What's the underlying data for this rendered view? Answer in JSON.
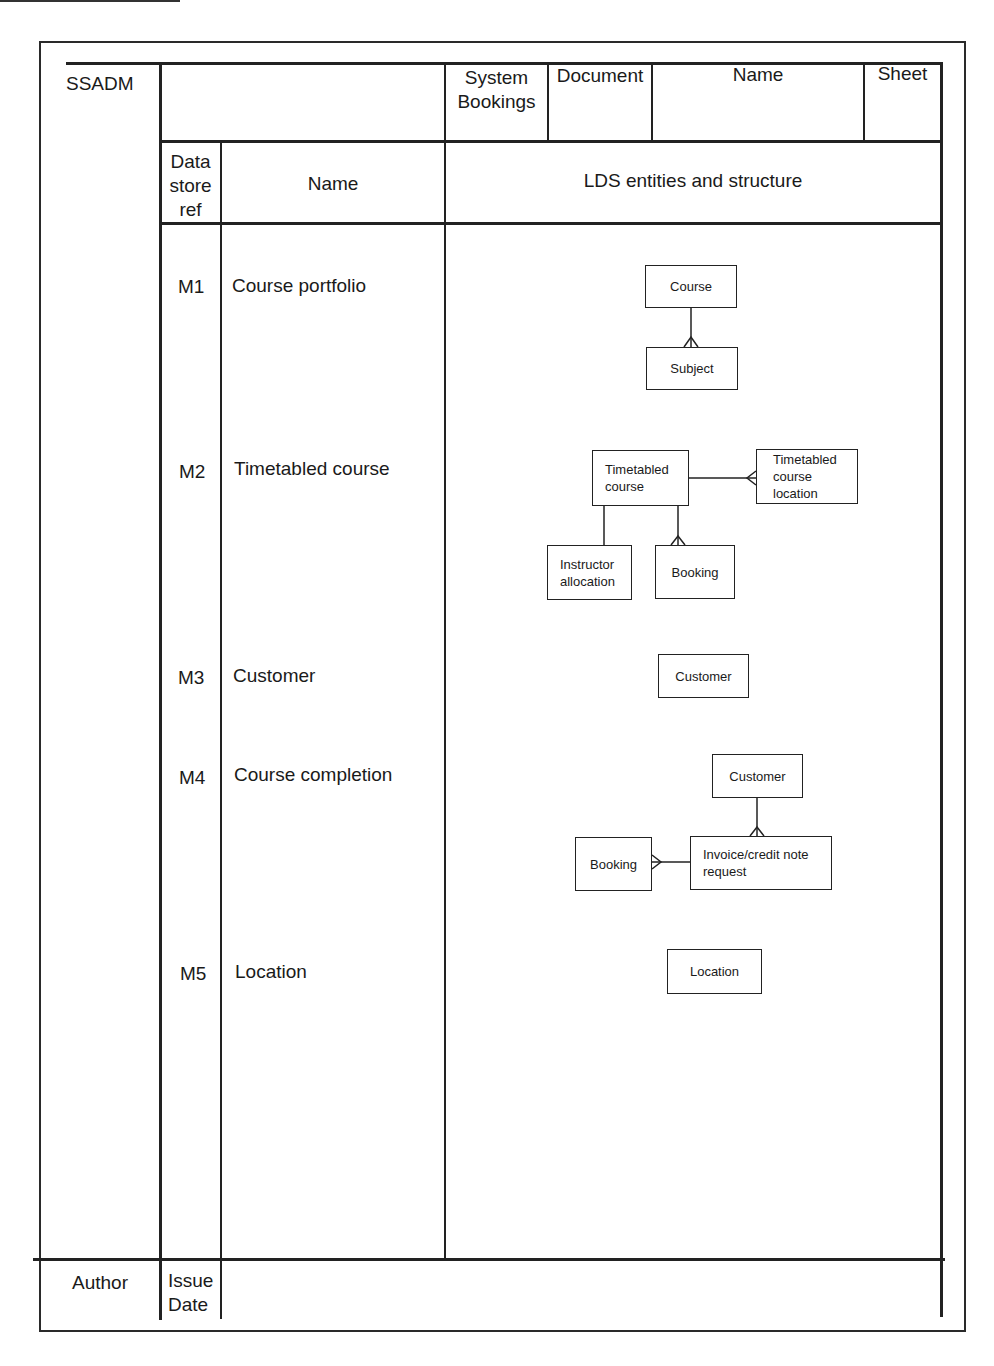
{
  "form": {
    "method": "SSADM",
    "header": {
      "system_label": "System",
      "system_value": "Bookings",
      "document_label": "Document",
      "name_label": "Name",
      "sheet_label": "Sheet"
    },
    "columns": {
      "ref": "Data store ref",
      "ref_lines": [
        "Data",
        "store",
        "ref"
      ],
      "name": "Name",
      "structure": "LDS entities and structure"
    },
    "footer": {
      "author_label": "Author",
      "issue_label": "Issue",
      "date_label": "Date"
    }
  },
  "rows": [
    {
      "ref": "M1",
      "name": "Course portfolio"
    },
    {
      "ref": "M2",
      "name": "Timetabled course"
    },
    {
      "ref": "M3",
      "name": "Customer"
    },
    {
      "ref": "M4",
      "name": "Course completion"
    },
    {
      "ref": "M5",
      "name": "Location"
    }
  ],
  "diagrams": {
    "m1": {
      "entities": [
        "Course",
        "Subject"
      ],
      "relationships": [
        {
          "from": "Course",
          "to": "Subject",
          "type": "one-to-many"
        }
      ]
    },
    "m2": {
      "entities": [
        "Timetabled course",
        "Timetabled course location",
        "Instructor allocation",
        "Booking"
      ],
      "timetabled_course_lines": [
        "Timetabled",
        "course"
      ],
      "location_lines": [
        "Timetabled",
        "course",
        "location"
      ],
      "instructor_lines": [
        "Instructor",
        "allocation"
      ],
      "relationships": [
        {
          "from": "Timetabled course",
          "to": "Timetabled course location",
          "type": "one-to-many"
        },
        {
          "from": "Timetabled course",
          "to": "Instructor allocation",
          "type": "one-to-one"
        },
        {
          "from": "Timetabled course",
          "to": "Booking",
          "type": "one-to-many"
        }
      ]
    },
    "m3": {
      "entities": [
        "Customer"
      ]
    },
    "m4": {
      "entities": [
        "Customer",
        "Booking",
        "Invoice/credit note request"
      ],
      "invoice_lines": [
        "Invoice/credit note",
        "request"
      ],
      "relationships": [
        {
          "from": "Customer",
          "to": "Invoice/credit note request",
          "type": "one-to-many"
        },
        {
          "from": "Invoice/credit note request",
          "to": "Booking",
          "type": "one-to-many"
        }
      ]
    },
    "m5": {
      "entities": [
        "Location"
      ]
    }
  }
}
